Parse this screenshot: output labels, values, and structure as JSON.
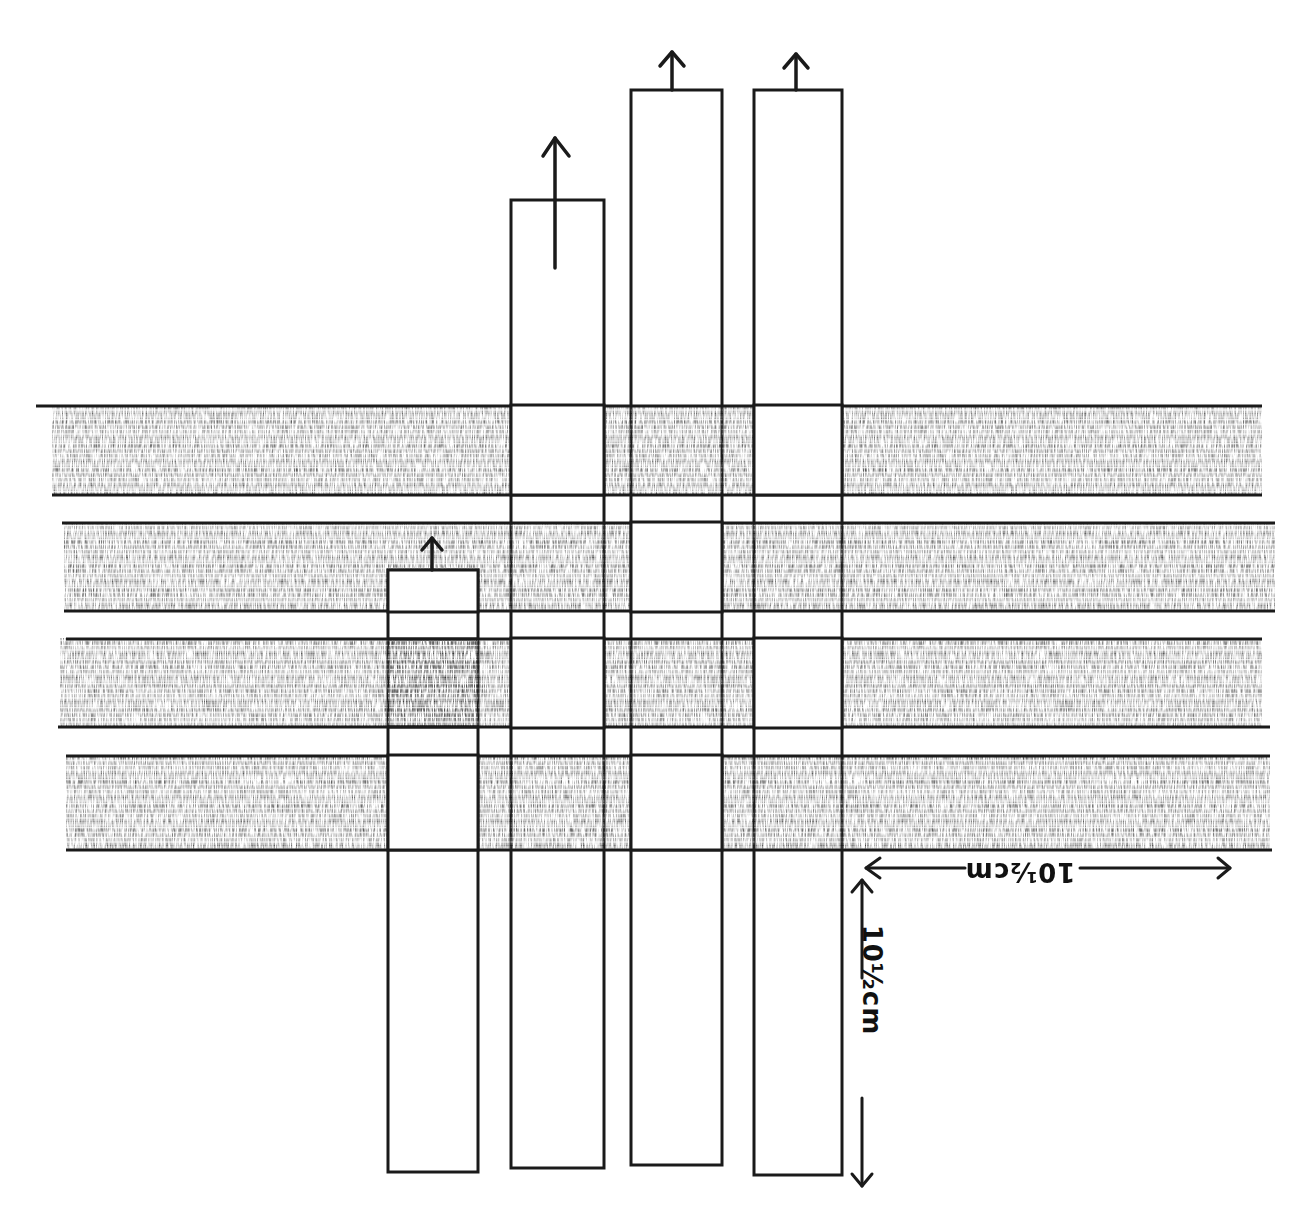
{
  "diagram": {
    "title": "",
    "colors": {
      "ink": "#1a1a1a",
      "weft_fill": "#6e6e6e",
      "weft_fill_light": "#a8a8a8",
      "warp_fill": "#ffffff",
      "background": "#ffffff"
    },
    "weft_strips": [
      {
        "id": "weft-1",
        "y_top": 405,
        "y_bottom": 495,
        "x_left": 52,
        "x_right": 1262
      },
      {
        "id": "weft-2",
        "y_top": 522,
        "y_bottom": 612,
        "x_left": 64,
        "x_right": 1275
      },
      {
        "id": "weft-3",
        "y_top": 638,
        "y_bottom": 728,
        "x_left": 60,
        "x_right": 1262
      },
      {
        "id": "weft-4",
        "y_top": 755,
        "y_bottom": 850,
        "x_left": 66,
        "x_right": 1270
      }
    ],
    "warp_strips": [
      {
        "id": "warp-1",
        "x_left": 388,
        "x_right": 478,
        "y_top": 570,
        "y_bottom": 1172,
        "pulled_up": true
      },
      {
        "id": "warp-2",
        "x_left": 511,
        "x_right": 604,
        "y_top": 200,
        "y_bottom": 1168,
        "pulled_up": true
      },
      {
        "id": "warp-3",
        "x_left": 631,
        "x_right": 722,
        "y_top": 90,
        "y_bottom": 1165,
        "pulled_up": true
      },
      {
        "id": "warp-4",
        "x_left": 754,
        "x_right": 842,
        "y_top": 90,
        "y_bottom": 1175,
        "pulled_up": true
      }
    ],
    "over_under": {
      "weft-1": [
        "over",
        "under",
        "over",
        "under"
      ],
      "weft-2": [
        "under",
        "over",
        "under",
        "over"
      ],
      "weft-3": [
        "over",
        "under",
        "over",
        "under"
      ],
      "weft-4": [
        "under",
        "over",
        "under",
        "over"
      ]
    },
    "arrows": [
      {
        "id": "arrow-warp-1",
        "x": 432,
        "y_from": 570,
        "y_to": 537,
        "direction": "up"
      },
      {
        "id": "arrow-warp-2",
        "x": 555,
        "y_from": 268,
        "y_to": 137,
        "direction": "up"
      },
      {
        "id": "arrow-warp-3",
        "x": 672,
        "y_from": 90,
        "y_to": 50,
        "direction": "up"
      },
      {
        "id": "arrow-warp-4",
        "x": 796,
        "y_from": 90,
        "y_to": 52,
        "direction": "up"
      }
    ],
    "dimensions": {
      "horizontal": {
        "label": "10½cm",
        "orientation": "upside-down",
        "x_from": 866,
        "x_to": 1230,
        "y": 868
      },
      "vertical": {
        "label": "10½cm",
        "orientation": "rotated-90",
        "x": 862,
        "y_from": 868,
        "y_to": 1190
      }
    }
  }
}
